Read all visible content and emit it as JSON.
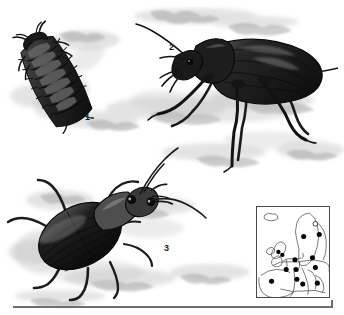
{
  "plate": {
    "kind": "natural-history-illustration-plate",
    "background_color": "#ffffff",
    "ink_color": "#1a1a1a",
    "shadow_color": "#b9b9b9",
    "width": 344,
    "height": 315
  },
  "figures": [
    {
      "id": "figure-1",
      "label": "1",
      "subject": "beetle-larva",
      "view": "dorsal",
      "orientation": "diagonal, head upper-right",
      "color": "#2b2b2b",
      "label_x": 85,
      "label_y": 112
    },
    {
      "id": "figure-2",
      "label": "2",
      "subject": "ground-beetle-adult",
      "view": "lateral",
      "orientation": "facing left",
      "color": "#1c1c1c",
      "label_x": 169,
      "label_y": 42
    },
    {
      "id": "figure-3",
      "label": "3",
      "subject": "ground-beetle-adult",
      "view": "dorsal-oblique",
      "orientation": "facing upper-right",
      "color": "#2a2a2a",
      "label_x": 164,
      "label_y": 243
    }
  ],
  "map": {
    "title": "europe-distribution-map",
    "frame_color": "#4a4a4a",
    "land_outline_color": "#3c3c3c",
    "present_marker": "filled-circle",
    "present_color": "#000000",
    "absent_marker": "open-circle",
    "absent_color": "#ffffff",
    "records": [
      {
        "marker": "open",
        "x": 60,
        "y": 17
      },
      {
        "marker": "filled",
        "x": 48,
        "y": 30
      },
      {
        "marker": "filled",
        "x": 64,
        "y": 28
      },
      {
        "marker": "filled",
        "x": 22,
        "y": 46
      },
      {
        "marker": "filled",
        "x": 26,
        "y": 49
      },
      {
        "marker": "filled",
        "x": 39,
        "y": 54
      },
      {
        "marker": "filled",
        "x": 57,
        "y": 52
      },
      {
        "marker": "filled",
        "x": 30,
        "y": 64
      },
      {
        "marker": "filled",
        "x": 40,
        "y": 64
      },
      {
        "marker": "filled",
        "x": 60,
        "y": 62
      },
      {
        "marker": "filled",
        "x": 15,
        "y": 76
      },
      {
        "marker": "filled",
        "x": 41,
        "y": 74
      },
      {
        "marker": "filled",
        "x": 47,
        "y": 79
      },
      {
        "marker": "filled",
        "x": 62,
        "y": 78
      }
    ]
  },
  "baseline": {
    "name": "plate-baseline-rule",
    "color": "#6e6e6e",
    "x": 13,
    "y": 306,
    "width": 320
  }
}
